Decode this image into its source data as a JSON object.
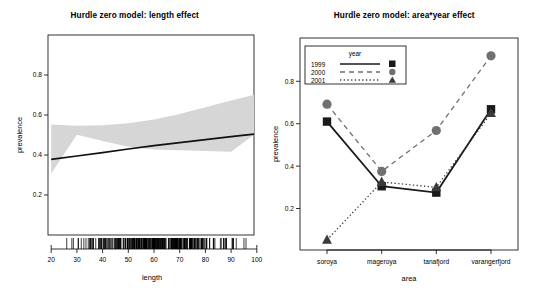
{
  "figure": {
    "width": 539,
    "height": 293,
    "background": "#ffffff",
    "panel_count": 2
  },
  "chart_data": [
    {
      "type": "line",
      "panel": "left",
      "title": "Hurdle zero model: length effect",
      "xlabel": "length",
      "ylabel": "prevalence",
      "xlim": [
        18,
        101
      ],
      "ylim": [
        0.0,
        1.0
      ],
      "xticks": [
        20,
        30,
        40,
        50,
        60,
        70,
        80,
        90,
        100
      ],
      "xtick_labels": [
        "20",
        "30",
        "40",
        "50",
        "60",
        "70",
        "80",
        "90",
        "100"
      ],
      "yticks": [
        0.2,
        0.4,
        0.6,
        0.8
      ],
      "ytick_labels": [
        "0.2",
        "0.4",
        "0.6",
        "0.8"
      ],
      "grid": false,
      "legend": "none",
      "fit_line": {
        "name": "fitted prevalence",
        "color": "#000000",
        "linewidth": 1.6,
        "x": [
          20,
          30,
          40,
          50,
          60,
          70,
          80,
          90,
          100
        ],
        "y": [
          0.378,
          0.395,
          0.412,
          0.43,
          0.447,
          0.462,
          0.477,
          0.492,
          0.506
        ]
      },
      "confidence_band": {
        "name": "95% confidence band",
        "color": "#d4d4d4",
        "x": [
          20,
          30,
          40,
          50,
          60,
          70,
          80,
          90,
          100
        ],
        "upper": [
          0.448,
          0.441,
          0.444,
          0.454,
          0.472,
          0.5,
          0.534,
          0.568,
          0.6
        ],
        "lower": [
          0.308,
          0.349,
          0.38,
          0.406,
          0.422,
          0.424,
          0.42,
          0.416,
          0.412
        ]
      },
      "rug": {
        "name": "length observations rug",
        "axis": "x",
        "color": "#000000",
        "note": "dense tick marks along bottom axis from about 19 to 101"
      }
    },
    {
      "type": "line",
      "panel": "right",
      "title": "Hurdle zero model: area*year effect",
      "xlabel": "area",
      "ylabel": "prevalence",
      "categories": [
        "soroya",
        "mageroya",
        "tanafjord",
        "varangerfjord"
      ],
      "ylim": [
        0.0,
        1.0
      ],
      "yticks": [
        0.2,
        0.4,
        0.6,
        0.8
      ],
      "ytick_labels": [
        "0.2",
        "0.4",
        "0.6",
        "0.8"
      ],
      "grid": false,
      "legend_title": "year",
      "legend_position": "top-left",
      "series": [
        {
          "name": "1999",
          "values": [
            0.61,
            0.305,
            0.275,
            0.668
          ],
          "linestyle": "solid",
          "marker": "square",
          "color": "#1a1a1a"
        },
        {
          "name": "2000",
          "values": [
            0.692,
            0.375,
            0.568,
            0.92
          ],
          "linestyle": "dashed",
          "marker": "circle",
          "color": "#707070"
        },
        {
          "name": "2001",
          "values": [
            0.052,
            0.325,
            0.3,
            0.65
          ],
          "linestyle": "dotted",
          "marker": "triangle",
          "color": "#3a3a3a"
        }
      ]
    }
  ],
  "left_panel": {
    "title": "Hurdle zero model: length effect",
    "xlabel": "length",
    "ylabel": "prevalence"
  },
  "right_panel": {
    "title": "Hurdle zero model: area*year effect",
    "xlabel": "area",
    "ylabel": "prevalence",
    "legend": {
      "title": "year",
      "entries": [
        "1999",
        "2000",
        "2001"
      ]
    }
  }
}
